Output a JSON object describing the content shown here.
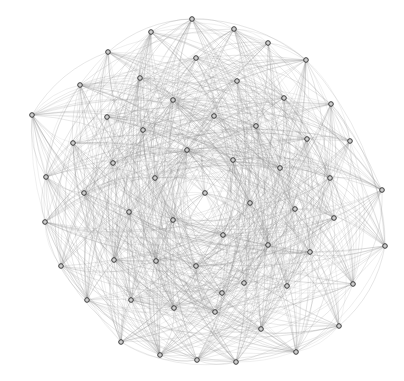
{
  "diagram": {
    "type": "network-graph",
    "layout": "circular-clustered",
    "edge_style": "curved",
    "colors": {
      "background": "#ffffff",
      "edge": "#8a8a8a",
      "node_fill": "#cfcfcf",
      "node_stroke": "#3a3a3a"
    },
    "nodes": [
      {
        "id": 1,
        "x": 151,
        "y": 32
      },
      {
        "id": 2,
        "x": 192,
        "y": 19
      },
      {
        "id": 3,
        "x": 234,
        "y": 29
      },
      {
        "id": 4,
        "x": 268,
        "y": 43
      },
      {
        "id": 5,
        "x": 306,
        "y": 60
      },
      {
        "id": 6,
        "x": 331,
        "y": 104
      },
      {
        "id": 7,
        "x": 350,
        "y": 141
      },
      {
        "id": 8,
        "x": 382,
        "y": 190
      },
      {
        "id": 9,
        "x": 385,
        "y": 246
      },
      {
        "id": 10,
        "x": 353,
        "y": 284
      },
      {
        "id": 11,
        "x": 339,
        "y": 326
      },
      {
        "id": 12,
        "x": 296,
        "y": 352
      },
      {
        "id": 13,
        "x": 236,
        "y": 362
      },
      {
        "id": 14,
        "x": 197,
        "y": 360
      },
      {
        "id": 15,
        "x": 160,
        "y": 355
      },
      {
        "id": 16,
        "x": 121,
        "y": 342
      },
      {
        "id": 17,
        "x": 87,
        "y": 300
      },
      {
        "id": 18,
        "x": 61,
        "y": 266
      },
      {
        "id": 19,
        "x": 45,
        "y": 222
      },
      {
        "id": 20,
        "x": 46,
        "y": 177
      },
      {
        "id": 21,
        "x": 32,
        "y": 115
      },
      {
        "id": 22,
        "x": 80,
        "y": 85
      },
      {
        "id": 23,
        "x": 108,
        "y": 52
      },
      {
        "id": 24,
        "x": 140,
        "y": 78
      },
      {
        "id": 25,
        "x": 196,
        "y": 58
      },
      {
        "id": 26,
        "x": 237,
        "y": 81
      },
      {
        "id": 27,
        "x": 284,
        "y": 98
      },
      {
        "id": 28,
        "x": 307,
        "y": 139
      },
      {
        "id": 29,
        "x": 330,
        "y": 178
      },
      {
        "id": 30,
        "x": 334,
        "y": 218
      },
      {
        "id": 31,
        "x": 310,
        "y": 252
      },
      {
        "id": 32,
        "x": 287,
        "y": 286
      },
      {
        "id": 33,
        "x": 261,
        "y": 329
      },
      {
        "id": 34,
        "x": 215,
        "y": 312
      },
      {
        "id": 35,
        "x": 174,
        "y": 308
      },
      {
        "id": 36,
        "x": 131,
        "y": 300
      },
      {
        "id": 37,
        "x": 114,
        "y": 260
      },
      {
        "id": 38,
        "x": 84,
        "y": 193
      },
      {
        "id": 39,
        "x": 73,
        "y": 143
      },
      {
        "id": 40,
        "x": 107,
        "y": 117
      },
      {
        "id": 41,
        "x": 173,
        "y": 100
      },
      {
        "id": 42,
        "x": 214,
        "y": 116
      },
      {
        "id": 43,
        "x": 256,
        "y": 126
      },
      {
        "id": 44,
        "x": 143,
        "y": 130
      },
      {
        "id": 45,
        "x": 187,
        "y": 150
      },
      {
        "id": 46,
        "x": 233,
        "y": 160
      },
      {
        "id": 47,
        "x": 280,
        "y": 168
      },
      {
        "id": 48,
        "x": 113,
        "y": 163
      },
      {
        "id": 49,
        "x": 155,
        "y": 178
      },
      {
        "id": 50,
        "x": 205,
        "y": 193
      },
      {
        "id": 51,
        "x": 250,
        "y": 203
      },
      {
        "id": 52,
        "x": 295,
        "y": 209
      },
      {
        "id": 53,
        "x": 129,
        "y": 212
      },
      {
        "id": 54,
        "x": 173,
        "y": 220
      },
      {
        "id": 55,
        "x": 223,
        "y": 235
      },
      {
        "id": 56,
        "x": 268,
        "y": 245
      },
      {
        "id": 57,
        "x": 156,
        "y": 261
      },
      {
        "id": 58,
        "x": 196,
        "y": 266
      },
      {
        "id": 59,
        "x": 244,
        "y": 283
      },
      {
        "id": 60,
        "x": 222,
        "y": 293
      }
    ],
    "edge_density": 0.55,
    "seed": 7
  }
}
